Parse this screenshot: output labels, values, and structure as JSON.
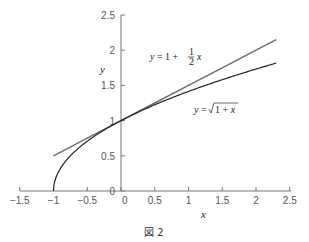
{
  "chart_data": {
    "type": "line",
    "title": "",
    "caption": "図 2",
    "xlabel": "x",
    "ylabel": "y",
    "xlim": [
      -1.5,
      2.5
    ],
    "ylim": [
      0,
      2.5
    ],
    "x_ticks": [
      "−1.5",
      "−1",
      "−0.5",
      "0",
      "0.5",
      "1",
      "1.5",
      "2",
      "2.5"
    ],
    "y_ticks": [
      "0",
      "0.5",
      "1",
      "1.5",
      "2",
      "2.5"
    ],
    "grid": false,
    "series": [
      {
        "name": "y = 1 + (1/2)x",
        "label_text": "y = 1 + ½ x",
        "color": "#6e6e6e",
        "x": [
          -1,
          -0.5,
          0,
          0.5,
          1,
          1.5,
          2,
          2.3
        ],
        "y": [
          0.5,
          0.75,
          1,
          1.25,
          1.5,
          1.75,
          2,
          2.15
        ]
      },
      {
        "name": "y = √(1+x)",
        "label_text": "y = √1 + x",
        "color": "#222222",
        "x": [
          -1,
          -0.75,
          -0.5,
          -0.25,
          0,
          0.5,
          1,
          1.5,
          2,
          2.3
        ],
        "y": [
          0,
          0.5,
          0.707,
          0.866,
          1,
          1.225,
          1.414,
          1.581,
          1.732,
          1.817
        ]
      }
    ]
  }
}
